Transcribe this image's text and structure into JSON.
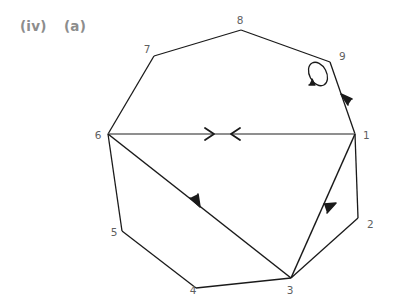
{
  "figure": {
    "caption_roman": "(iv)",
    "caption_letter": "(a)",
    "caption_color": "#8d8d8d",
    "background_color": "#ffffff",
    "edge_color": "#1a1a1a",
    "chord_color": "#6a6a6a",
    "label_color": "#5f5f5f",
    "nodes": [
      {
        "id": "1",
        "label": "1",
        "x": 355,
        "y": 134,
        "label_x": 363,
        "label_y": 135
      },
      {
        "id": "2",
        "label": "2",
        "x": 358,
        "y": 218,
        "label_x": 367,
        "label_y": 226
      },
      {
        "id": "3",
        "label": "3",
        "x": 291,
        "y": 278,
        "label_x": 289,
        "label_y": 292
      },
      {
        "id": "4",
        "label": "4",
        "x": 196,
        "y": 288,
        "label_x": 192,
        "label_y": 292
      },
      {
        "id": "5",
        "label": "5",
        "x": 122,
        "y": 231,
        "label_x": 113,
        "label_y": 234
      },
      {
        "id": "6",
        "label": "6",
        "x": 108,
        "y": 134,
        "label_x": 97,
        "label_y": 138
      },
      {
        "id": "7",
        "label": "7",
        "x": 154,
        "y": 56,
        "label_x": 146,
        "label_y": 52
      },
      {
        "id": "8",
        "label": "8",
        "x": 241,
        "y": 30,
        "label_x": 239,
        "label_y": 23
      },
      {
        "id": "9",
        "label": "9",
        "x": 330,
        "y": 62,
        "label_x": 338,
        "label_y": 58
      }
    ],
    "edges": [
      {
        "id": "e-1-2",
        "from": "1",
        "to": "2",
        "directed": false,
        "style": "polygon"
      },
      {
        "id": "e-2-3",
        "from": "2",
        "to": "3",
        "directed": false,
        "style": "polygon"
      },
      {
        "id": "e-3-4",
        "from": "3",
        "to": "4",
        "directed": false,
        "style": "polygon"
      },
      {
        "id": "e-4-5",
        "from": "4",
        "to": "5",
        "directed": false,
        "style": "polygon"
      },
      {
        "id": "e-5-6",
        "from": "5",
        "to": "6",
        "directed": false,
        "style": "polygon"
      },
      {
        "id": "e-6-7",
        "from": "6",
        "to": "7",
        "directed": false,
        "style": "polygon"
      },
      {
        "id": "e-7-8",
        "from": "7",
        "to": "8",
        "directed": false,
        "style": "polygon"
      },
      {
        "id": "e-8-9",
        "from": "8",
        "to": "9",
        "directed": false,
        "style": "polygon"
      },
      {
        "id": "e-9-1",
        "from": "9",
        "to": "1",
        "directed": true,
        "arrow_direction": "toward-9",
        "style": "polygon"
      },
      {
        "id": "e-6-1",
        "from": "6",
        "to": "1",
        "directed": true,
        "bidirectional": true,
        "style": "chord"
      },
      {
        "id": "e-6-3",
        "from": "6",
        "to": "3",
        "directed": true,
        "arrow_direction": "toward-3",
        "style": "chord-dark"
      },
      {
        "id": "e-3-1",
        "from": "3",
        "to": "1",
        "directed": true,
        "arrow_direction": "toward-1",
        "style": "chord-dark"
      }
    ],
    "self_loops": [
      {
        "id": "loop-9",
        "node": "9",
        "cx": 318,
        "cy": 73,
        "rx": 8,
        "ry": 12,
        "rotation": -25,
        "arrow": true
      }
    ]
  }
}
